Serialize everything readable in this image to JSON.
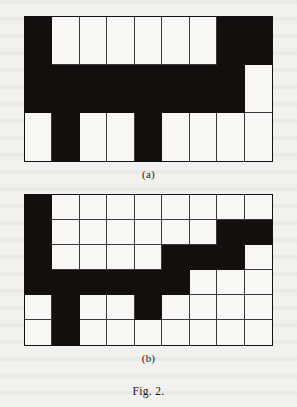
{
  "figure": {
    "label": "Fig. 2.",
    "colors": {
      "filled": "#120f0d",
      "empty": "#f8f7f4",
      "gridline": "#3a3a3a",
      "border": "#111111",
      "page_background": "#f2f1ee"
    }
  },
  "panels": [
    {
      "id": "a",
      "caption": "(a)",
      "rows": 3,
      "cols": 9,
      "legend": {
        "filled": 1,
        "empty": 0
      },
      "matrix": [
        [
          1,
          0,
          0,
          0,
          0,
          0,
          0,
          1,
          1
        ],
        [
          1,
          1,
          1,
          1,
          1,
          1,
          1,
          1,
          0
        ],
        [
          0,
          1,
          0,
          0,
          1,
          0,
          0,
          0,
          0
        ]
      ]
    },
    {
      "id": "b",
      "caption": "(b)",
      "rows": 6,
      "cols": 9,
      "legend": {
        "filled": 1,
        "empty": 0
      },
      "matrix": [
        [
          1,
          0,
          0,
          0,
          0,
          0,
          0,
          0,
          0
        ],
        [
          1,
          0,
          0,
          0,
          0,
          0,
          0,
          1,
          1
        ],
        [
          1,
          0,
          0,
          0,
          0,
          1,
          1,
          1,
          0
        ],
        [
          1,
          1,
          1,
          1,
          1,
          1,
          0,
          0,
          0
        ],
        [
          0,
          1,
          0,
          0,
          1,
          0,
          0,
          0,
          0
        ],
        [
          0,
          1,
          0,
          0,
          0,
          0,
          0,
          0,
          0
        ]
      ]
    }
  ]
}
